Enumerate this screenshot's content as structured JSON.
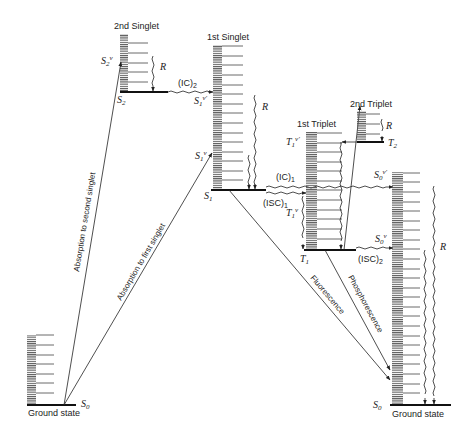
{
  "diagram": {
    "type": "jablonski-energy-level-diagram",
    "states": {
      "ground_left": {
        "title": "Ground state",
        "symbol": "S",
        "subscript": "0"
      },
      "second_singlet": {
        "title": "2nd Singlet",
        "symbol": "S",
        "subscript": "2",
        "vib_symbol": "S",
        "vib_sub": "2",
        "vib_sup": "v"
      },
      "first_singlet": {
        "title": "1st Singlet",
        "symbol": "S",
        "subscript": "1",
        "vib_upper_symbol": "S",
        "vib_upper_sub": "1",
        "vib_upper_sup": "v'",
        "vib_lower_symbol": "S",
        "vib_lower_sub": "1",
        "vib_lower_sup": "v"
      },
      "first_triplet": {
        "title": "1st Triplet",
        "symbol": "T",
        "subscript": "1",
        "vib_upper_symbol": "T",
        "vib_upper_sub": "1",
        "vib_upper_sup": "v'",
        "vib_lower_symbol": "T",
        "vib_lower_sub": "1",
        "vib_lower_sup": "v"
      },
      "second_triplet": {
        "title": "2nd Triplet",
        "symbol": "T",
        "subscript": "2"
      },
      "ground_right": {
        "title": "Ground state",
        "symbol": "S",
        "subscript": "0",
        "vib_upper_symbol": "S",
        "vib_upper_sub": "0",
        "vib_upper_sup": "v'",
        "vib_lower_symbol": "S",
        "vib_lower_sub": "0",
        "vib_lower_sup": "v"
      }
    },
    "transitions": {
      "abs_second": "Absorption to second singlet",
      "abs_first": "Absorption to first singlet",
      "ic2": "(IC)",
      "ic2_sub": "2",
      "ic1": "(IC)",
      "ic1_sub": "1",
      "isc1": "(ISC)",
      "isc1_sub": "1",
      "isc2": "(ISC)",
      "isc2_sub": "2",
      "fluorescence": "Fluorescence",
      "phosphorescence": "Phosphorescence",
      "relaxation": "R"
    }
  }
}
